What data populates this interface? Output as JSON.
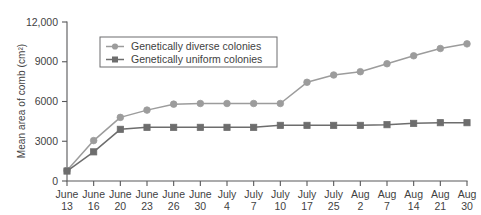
{
  "chart_data": {
    "type": "line",
    "title": "",
    "xlabel": "",
    "ylabel": "Mean area of comb (cm²)",
    "ylim": [
      0,
      12000
    ],
    "yticks": [
      0,
      3000,
      6000,
      9000,
      12000
    ],
    "ytick_labels": [
      "0",
      "3000",
      "6000",
      "9000",
      "12,000"
    ],
    "grid": false,
    "legend_position": "upper-left-inside",
    "categories": [
      "June 13",
      "June 16",
      "June 20",
      "June 23",
      "June 26",
      "June 30",
      "July 4",
      "July 7",
      "July 10",
      "July 17",
      "July 25",
      "Aug 2",
      "Aug 7",
      "Aug 14",
      "Aug 21",
      "Aug 30"
    ],
    "xtick_months": [
      "June",
      "June",
      "June",
      "June",
      "June",
      "June",
      "July",
      "July",
      "July",
      "July",
      "July",
      "Aug",
      "Aug",
      "Aug",
      "Aug",
      "Aug"
    ],
    "xtick_days": [
      "13",
      "16",
      "20",
      "23",
      "26",
      "30",
      "4",
      "7",
      "10",
      "17",
      "25",
      "2",
      "7",
      "14",
      "21",
      "30"
    ],
    "series": [
      {
        "name": "Genetically diverse colonies",
        "color": "#9c9c9c",
        "marker": "circle",
        "values": [
          800,
          3050,
          4800,
          5350,
          5800,
          5850,
          5850,
          5850,
          5850,
          7450,
          8000,
          8250,
          8850,
          9450,
          10000,
          10350
        ]
      },
      {
        "name": "Genetically uniform colonies",
        "color": "#6d6d6d",
        "marker": "square",
        "values": [
          750,
          2200,
          3900,
          4050,
          4050,
          4050,
          4050,
          4050,
          4200,
          4200,
          4200,
          4200,
          4250,
          4350,
          4400,
          4400
        ]
      }
    ]
  },
  "legend": {
    "items": [
      {
        "label": "Genetically diverse colonies"
      },
      {
        "label": "Genetically uniform colonies"
      }
    ]
  }
}
